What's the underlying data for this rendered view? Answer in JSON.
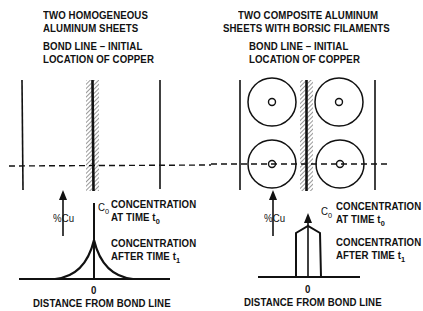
{
  "left_panel": {
    "title_line1": "TWO HOMOGENEOUS",
    "title_line2": "ALUMINUM SHEETS",
    "bond_line1": "BOND LINE – INITIAL",
    "bond_line2": "LOCATION OF COPPER",
    "y_axis_label": "%Cu",
    "c0_label": "C",
    "c0_sub": "0",
    "conc_t0_line1": "CONCENTRATION",
    "conc_t0_line2": "AT TIME t",
    "conc_t0_sub": "0",
    "conc_t1_line1": "CONCENTRATION",
    "conc_t1_line2": "AFTER TIME t",
    "conc_t1_sub": "1",
    "x_origin": "0",
    "x_axis_label": "DISTANCE FROM BOND LINE",
    "profile_shape": "exponential-cusp"
  },
  "right_panel": {
    "title_line1": "TWO COMPOSITE ALUMINUM",
    "title_line2": "SHEETS WITH BORSIC FILAMENTS",
    "bond_line1": "BOND LINE – INITIAL",
    "bond_line2": "LOCATION OF COPPER",
    "y_axis_label": "%Cu",
    "c0_label": "C",
    "c0_sub": "0",
    "conc_t0_line1": "CONCENTRATION",
    "conc_t0_line2": "AT TIME t",
    "conc_t0_sub": "0",
    "conc_t1_line1": "CONCENTRATION",
    "conc_t1_line2": "AFTER TIME t",
    "conc_t1_sub": "1",
    "x_origin": "0",
    "x_axis_label": "DISTANCE FROM BOND LINE",
    "profile_shape": "flat-topped-pentagon",
    "filaments": 4
  },
  "colors": {
    "ink": "#111111",
    "background": "#ffffff"
  }
}
